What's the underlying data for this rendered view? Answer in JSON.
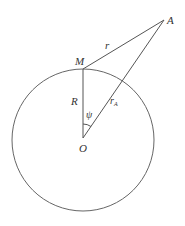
{
  "diagram": {
    "colors": {
      "line": "#555555",
      "text": "#333333",
      "background": "#ffffff"
    },
    "points": {
      "A": {
        "label": "A",
        "x": 164,
        "y": 20
      },
      "M": {
        "label": "M",
        "x": 83,
        "y": 69
      },
      "O": {
        "label": "O",
        "x": 83,
        "y": 138
      }
    },
    "circle": {
      "cx": 83,
      "cy": 140,
      "r": 71
    },
    "segments": [
      {
        "from": "M",
        "to": "A",
        "label": "r"
      },
      {
        "from": "O",
        "to": "A",
        "label": "r",
        "subscript": "A"
      },
      {
        "from": "O",
        "to": "M",
        "label": "R"
      }
    ],
    "angle": {
      "vertex": "O",
      "label": "ψ"
    }
  }
}
